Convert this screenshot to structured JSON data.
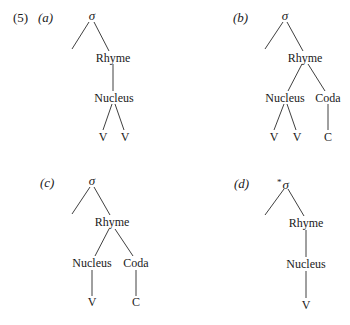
{
  "example_number": "(5)",
  "panels": [
    {
      "id": "a",
      "label": "(a)",
      "root": "σ",
      "root_star": "",
      "nodes": {
        "rhyme": "Rhyme",
        "nucleus": "Nucleus",
        "v1": "V",
        "v2": "V"
      }
    },
    {
      "id": "b",
      "label": "(b)",
      "root": "σ",
      "root_star": "",
      "nodes": {
        "rhyme": "Rhyme",
        "nucleus": "Nucleus",
        "coda": "Coda",
        "v1": "V",
        "v2": "V",
        "c": "C"
      }
    },
    {
      "id": "c",
      "label": "(c)",
      "root": "σ",
      "root_star": "",
      "nodes": {
        "rhyme": "Rhyme",
        "nucleus": "Nucleus",
        "coda": "Coda",
        "v": "V",
        "c": "C"
      }
    },
    {
      "id": "d",
      "label": "(d)",
      "root": "σ",
      "root_star": "*",
      "nodes": {
        "rhyme": "Rhyme",
        "nucleus": "Nucleus",
        "v": "V"
      }
    }
  ]
}
